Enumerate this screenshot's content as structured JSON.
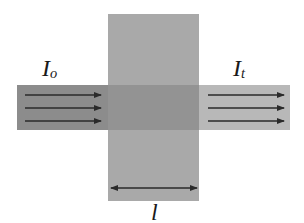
{
  "diagram": {
    "incident_label": {
      "main": "I",
      "sub": "o"
    },
    "transmitted_label": {
      "main": "I",
      "sub": "t"
    },
    "thickness_label": "l",
    "colors": {
      "background": "#ffffff",
      "slab": "#a9a9a9",
      "incident_beam": "#8c8c8c",
      "overlap": "#939393",
      "transmitted_beam": "#b8b8b8",
      "arrows": "#2a2a2a",
      "text": "#1a1a1a"
    },
    "geometry": {
      "slab": {
        "x": 108,
        "y": 14,
        "width": 91,
        "height": 187
      },
      "beam": {
        "x": 17,
        "y": 85,
        "width": 273,
        "height": 45
      },
      "incident_arrows_y": [
        95,
        108,
        121
      ],
      "transmitted_arrows_y": [
        95,
        108,
        121
      ],
      "thickness_arrow_y": 188
    }
  }
}
